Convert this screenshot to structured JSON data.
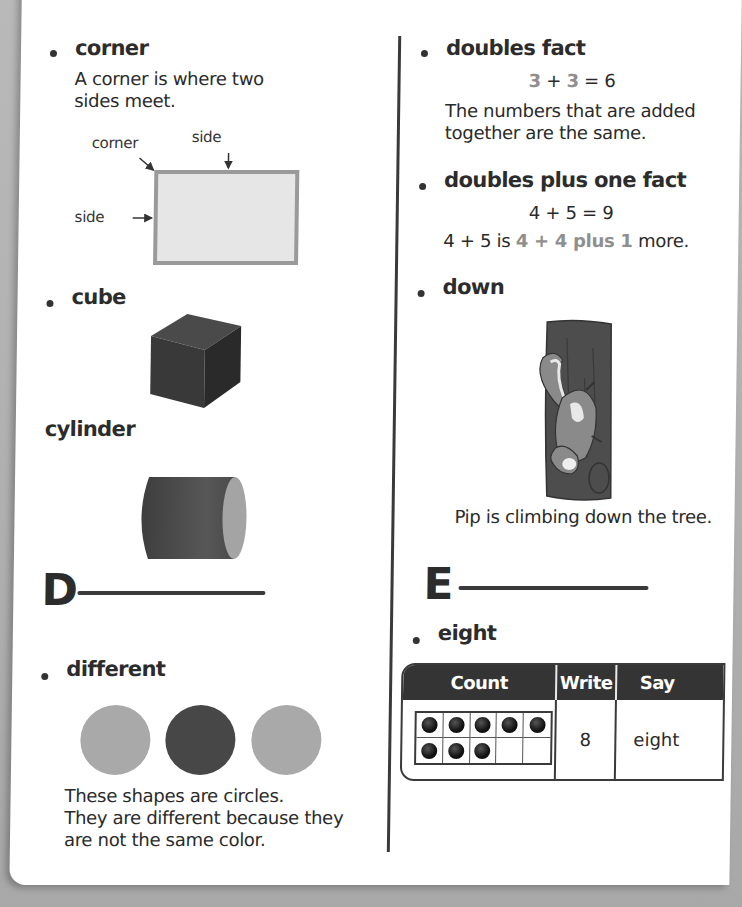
{
  "left_column": {
    "corner": {
      "term": "corner",
      "definition_line1": "A corner is where two",
      "definition_line2": "sides meet.",
      "diagram_labels": {
        "corner": "corner",
        "side_top": "side",
        "side_left": "side"
      }
    },
    "cube": {
      "term": "cube"
    },
    "cylinder": {
      "term": "cylinder"
    },
    "section_letter": "D",
    "different": {
      "term": "different",
      "circles": [
        {
          "shade": "#a9a9a9"
        },
        {
          "shade": "#474747"
        },
        {
          "shade": "#a9a9a9"
        }
      ],
      "caption_line1": "These shapes are circles.",
      "caption_line2": "They are different because they",
      "caption_line3": "are not the same color."
    }
  },
  "right_column": {
    "doubles_fact": {
      "term": "doubles fact",
      "equation": {
        "a": "3",
        "plus": "+",
        "b": "3",
        "equals": "= 6"
      },
      "definition_line1": "The numbers that are added",
      "definition_line2": "together are the same."
    },
    "doubles_plus_one": {
      "term": "doubles plus one fact",
      "equation": "4 + 5 = 9",
      "explanation": {
        "prefix": "4 + 5 is ",
        "hl_a": "4",
        "plus": " + ",
        "hl_b": "4 plus 1",
        "suffix": " more."
      }
    },
    "down": {
      "term": "down",
      "caption": "Pip is climbing down the tree."
    },
    "section_letter": "E",
    "eight": {
      "term": "eight",
      "table": {
        "headers": [
          "Count",
          "Write",
          "Say"
        ],
        "ten_frame_filled": 8,
        "ten_frame_total": 10,
        "write": "8",
        "say": "eight"
      }
    }
  }
}
